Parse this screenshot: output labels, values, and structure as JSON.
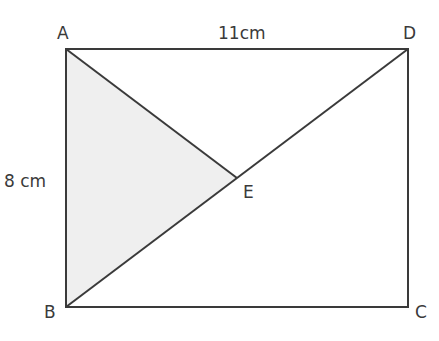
{
  "diagram": {
    "type": "geometry-rectangle",
    "colors": {
      "stroke": "#3a3a3a",
      "shade": "#efefef",
      "background": "#ffffff"
    },
    "points": {
      "A": {
        "label": "A",
        "x": 66,
        "y": 49
      },
      "D": {
        "label": "D",
        "x": 408,
        "y": 49
      },
      "B": {
        "label": "B",
        "x": 66,
        "y": 307
      },
      "C": {
        "label": "C",
        "x": 408,
        "y": 307
      },
      "E": {
        "label": "E",
        "x": 237,
        "y": 178
      }
    },
    "dimensions": {
      "top": "11cm",
      "left": "8 cm"
    },
    "shaded_region": "triangle ABE"
  }
}
